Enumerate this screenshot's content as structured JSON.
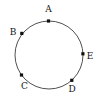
{
  "figure": {
    "type": "circle-diagram",
    "width": 104,
    "height": 102,
    "background_color": "#ffffff",
    "circle": {
      "center_x": 49,
      "center_y": 55,
      "radius": 34,
      "stroke_color": "#3c3c3c",
      "stroke_width": 0.9,
      "fill": "none"
    },
    "marker": {
      "shape": "square",
      "size": 3.2,
      "color": "#111111"
    },
    "points": [
      {
        "id": "A",
        "label": "A",
        "angle_deg": 90,
        "point_x": 48.5,
        "point_y": 21,
        "label_x": 48.5,
        "label_y": 9,
        "label_position": "above"
      },
      {
        "id": "B",
        "label": "B",
        "angle_deg": 143,
        "point_x": 21.8,
        "point_y": 33.4,
        "label_x": 13,
        "label_y": 32,
        "label_position": "left"
      },
      {
        "id": "C",
        "label": "C",
        "angle_deg": 216,
        "point_x": 21.5,
        "point_y": 75,
        "label_x": 24.5,
        "label_y": 86,
        "label_position": "below-left"
      },
      {
        "id": "D",
        "label": "D",
        "angle_deg": 312,
        "point_x": 71.8,
        "point_y": 80.3,
        "label_x": 72,
        "label_y": 89,
        "label_position": "below-right"
      },
      {
        "id": "E",
        "label": "E",
        "angle_deg": 2,
        "point_x": 82.9,
        "point_y": 53.8,
        "label_x": 90,
        "label_y": 56,
        "label_position": "right"
      }
    ]
  }
}
